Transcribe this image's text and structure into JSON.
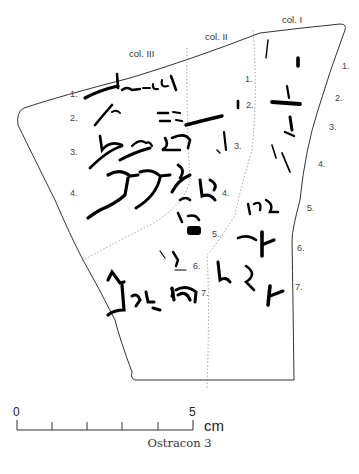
{
  "figure": {
    "caption": "Ostracon 3",
    "columns": {
      "col3": "col. III",
      "col2": "col. II",
      "col1": "col. I"
    },
    "line_numbers": {
      "col3": [
        "1.",
        "2.",
        "3.",
        "4."
      ],
      "col2": [
        "1.",
        "2.",
        "3.",
        "4.",
        "5.",
        "6.",
        "7."
      ],
      "col1": [
        "1.",
        "2.",
        "3.",
        "4.",
        "5.",
        "6.",
        "7."
      ]
    },
    "scale_bar": {
      "start_label": "0",
      "end_label": "5",
      "unit": "cm",
      "ticks": 6
    },
    "colors": {
      "ink": "#000000",
      "outline": "#333333",
      "divider": "#888888"
    }
  }
}
